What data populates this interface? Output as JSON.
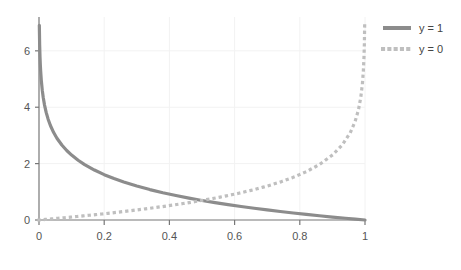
{
  "chart_data": {
    "type": "line",
    "title": "",
    "subtitle": "",
    "xlabel": "",
    "ylabel": "",
    "xlim": [
      0,
      1
    ],
    "ylim": [
      0,
      7.2
    ],
    "grid": true,
    "legend_position": "top-right",
    "xticks": [
      0,
      0.2,
      0.4,
      0.6,
      0.8,
      1
    ],
    "xtick_labels": [
      "0",
      "0.2",
      "0.4",
      "0.6",
      "0.8",
      "1"
    ],
    "yticks": [
      0,
      2,
      4,
      6
    ],
    "ytick_labels": [
      "0",
      "2",
      "4",
      "6"
    ],
    "series": [
      {
        "name": "y = 1",
        "style": "solid",
        "color": "#8c8c8c",
        "width": 3.2,
        "x": [
          0.001,
          0.002,
          0.003,
          0.004,
          0.005,
          0.007,
          0.01,
          0.013,
          0.017,
          0.022,
          0.028,
          0.035,
          0.045,
          0.055,
          0.07,
          0.085,
          0.1,
          0.12,
          0.14,
          0.17,
          0.2,
          0.23,
          0.26,
          0.3,
          0.34,
          0.38,
          0.42,
          0.46,
          0.5,
          0.54,
          0.58,
          0.62,
          0.66,
          0.7,
          0.74,
          0.78,
          0.82,
          0.86,
          0.9,
          0.94,
          0.97,
          1.0
        ],
        "y": [
          6.908,
          6.215,
          5.809,
          5.521,
          5.298,
          4.962,
          4.605,
          4.343,
          4.075,
          3.817,
          3.576,
          3.352,
          3.101,
          2.9,
          2.659,
          2.465,
          2.303,
          2.12,
          1.966,
          1.772,
          1.609,
          1.47,
          1.347,
          1.204,
          1.079,
          0.968,
          0.868,
          0.777,
          0.693,
          0.616,
          0.545,
          0.478,
          0.416,
          0.357,
          0.301,
          0.248,
          0.198,
          0.151,
          0.105,
          0.062,
          0.03,
          0.0
        ]
      },
      {
        "name": "y = 0",
        "style": "dotted",
        "color": "#bfbfbf",
        "width": 3.2,
        "x": [
          0.0,
          0.03,
          0.06,
          0.1,
          0.14,
          0.18,
          0.22,
          0.26,
          0.3,
          0.34,
          0.38,
          0.42,
          0.46,
          0.5,
          0.54,
          0.58,
          0.62,
          0.66,
          0.7,
          0.74,
          0.78,
          0.82,
          0.86,
          0.9,
          0.93,
          0.955,
          0.97,
          0.98,
          0.987,
          0.992,
          0.995,
          0.997,
          0.998,
          0.999
        ],
        "y": [
          0.0,
          0.03,
          0.062,
          0.105,
          0.151,
          0.198,
          0.248,
          0.301,
          0.357,
          0.416,
          0.478,
          0.545,
          0.616,
          0.693,
          0.777,
          0.868,
          0.968,
          1.079,
          1.204,
          1.347,
          1.514,
          1.715,
          1.966,
          2.303,
          2.659,
          3.101,
          3.507,
          3.912,
          4.343,
          4.828,
          5.298,
          5.809,
          6.215,
          6.908
        ]
      }
    ],
    "annotations": []
  },
  "legend": {
    "entries": [
      {
        "label": "y = 1",
        "marker": "solid-line-swatch"
      },
      {
        "label": "y = 0",
        "marker": "dotted-line-swatch"
      }
    ]
  },
  "axes": {
    "axis_color": "#777777",
    "grid_color": "#f2f2f2",
    "tick_label_color": "#555555",
    "background": "#ffffff"
  }
}
